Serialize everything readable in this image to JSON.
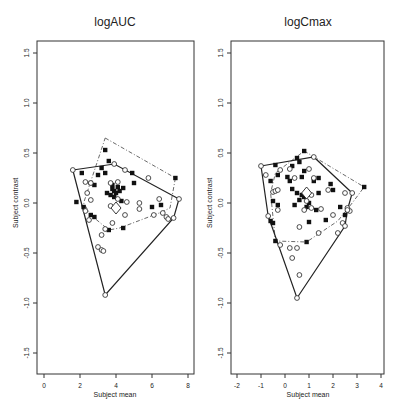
{
  "chart_data": [
    {
      "type": "scatter",
      "title": "logAUC",
      "xlabel": "Subject mean",
      "ylabel": "Subject contrast",
      "xlim": [
        -0.5,
        8.3
      ],
      "ylim": [
        -1.6,
        1.6
      ],
      "xticks": [
        0,
        2,
        4,
        6,
        8
      ],
      "yticks": [
        -1.5,
        -1.0,
        -0.5,
        0.0,
        0.5,
        1.0,
        1.5
      ],
      "grid": false,
      "legend": null,
      "hull_solid": [
        [
          1.6,
          0.33
        ],
        [
          3.9,
          0.39
        ],
        [
          7.5,
          0.04
        ],
        [
          7.2,
          -0.15
        ],
        [
          3.4,
          -0.92
        ],
        [
          1.6,
          0.33
        ]
      ],
      "hull_dashdot": [
        [
          3.4,
          0.65
        ],
        [
          7.3,
          0.25
        ],
        [
          7.0,
          -0.05
        ],
        [
          6.4,
          -0.1
        ],
        [
          4.2,
          -0.25
        ],
        [
          3.6,
          -0.27
        ],
        [
          2.6,
          -0.12
        ],
        [
          2.2,
          0.0
        ],
        [
          3.4,
          0.65
        ]
      ],
      "series": [
        {
          "name": "filled squares",
          "marker": "square-filled",
          "points": [
            [
              3.4,
              0.53
            ],
            [
              3.6,
              0.42
            ],
            [
              3.2,
              0.35
            ],
            [
              3.0,
              0.28
            ],
            [
              3.4,
              0.3
            ],
            [
              2.1,
              0.3
            ],
            [
              2.6,
              0.2
            ],
            [
              2.8,
              0.18
            ],
            [
              4.9,
              0.3
            ],
            [
              5.0,
              0.2
            ],
            [
              7.3,
              0.25
            ],
            [
              3.8,
              0.14
            ],
            [
              3.9,
              0.12
            ],
            [
              4.0,
              0.1
            ],
            [
              3.7,
              0.08
            ],
            [
              3.9,
              0.06
            ],
            [
              4.1,
              0.16
            ],
            [
              3.8,
              0.18
            ],
            [
              4.2,
              0.12
            ],
            [
              4.3,
              0.02
            ],
            [
              4.4,
              0.15
            ],
            [
              3.5,
              0.1
            ],
            [
              1.8,
              0.01
            ],
            [
              2.2,
              -0.04
            ],
            [
              2.6,
              -0.12
            ],
            [
              2.8,
              -0.14
            ],
            [
              6.0,
              -0.04
            ],
            [
              6.5,
              -0.02
            ],
            [
              3.6,
              -0.27
            ],
            [
              4.4,
              -0.25
            ]
          ]
        },
        {
          "name": "open circles",
          "marker": "circle-open",
          "points": [
            [
              1.6,
              0.33
            ],
            [
              3.9,
              0.39
            ],
            [
              4.5,
              0.33
            ],
            [
              5.8,
              0.25
            ],
            [
              2.3,
              0.21
            ],
            [
              2.6,
              0.2
            ],
            [
              3.7,
              0.2
            ],
            [
              4.1,
              0.21
            ],
            [
              2.4,
              0.1
            ],
            [
              2.6,
              0.03
            ],
            [
              4.1,
              0.04
            ],
            [
              4.6,
              0.01
            ],
            [
              5.3,
              0.0
            ],
            [
              5.3,
              -0.06
            ],
            [
              3.7,
              -0.03
            ],
            [
              2.3,
              -0.08
            ],
            [
              2.5,
              -0.17
            ],
            [
              4.5,
              -0.12
            ],
            [
              3.8,
              -0.2
            ],
            [
              3.4,
              -0.26
            ],
            [
              3.2,
              -0.32
            ],
            [
              3.0,
              -0.44
            ],
            [
              3.2,
              -0.47
            ],
            [
              3.3,
              -0.48
            ],
            [
              6.1,
              -0.12
            ],
            [
              6.6,
              -0.1
            ],
            [
              6.8,
              -0.14
            ],
            [
              6.9,
              -0.16
            ],
            [
              7.2,
              -0.15
            ],
            [
              7.5,
              0.04
            ],
            [
              6.4,
              0.04
            ],
            [
              3.4,
              -0.92
            ]
          ]
        },
        {
          "name": "center",
          "marker": "diamond-open",
          "points": [
            [
              4.0,
              -0.05
            ]
          ]
        }
      ]
    },
    {
      "type": "scatter",
      "title": "logCmax",
      "xlabel": "Subject mean",
      "ylabel": "Subject contrast",
      "xlim": [
        -2.3,
        4.3
      ],
      "ylim": [
        -1.6,
        1.6
      ],
      "xticks": [
        -2,
        -1,
        0,
        1,
        2,
        3,
        4
      ],
      "yticks": [
        -1.5,
        -1.0,
        -0.5,
        0.0,
        0.5,
        1.0,
        1.5
      ],
      "grid": false,
      "legend": null,
      "hull_solid": [
        [
          -1.0,
          0.37
        ],
        [
          1.2,
          0.46
        ],
        [
          2.8,
          0.1
        ],
        [
          2.6,
          -0.07
        ],
        [
          2.5,
          -0.23
        ],
        [
          0.5,
          -0.95
        ],
        [
          -0.7,
          -0.13
        ],
        [
          -1.0,
          0.37
        ]
      ],
      "hull_dashdot": [
        [
          0.8,
          0.52
        ],
        [
          3.3,
          0.16
        ],
        [
          2.8,
          0.0
        ],
        [
          2.2,
          -0.18
        ],
        [
          0.9,
          -0.39
        ],
        [
          -0.4,
          -0.38
        ],
        [
          -0.6,
          0.1
        ],
        [
          -0.4,
          0.3
        ],
        [
          0.8,
          0.52
        ]
      ],
      "series": [
        {
          "name": "filled squares",
          "marker": "square-filled",
          "points": [
            [
              0.8,
              0.52
            ],
            [
              0.5,
              0.45
            ],
            [
              0.6,
              0.41
            ],
            [
              -0.4,
              0.38
            ],
            [
              0.3,
              0.37
            ],
            [
              0.8,
              0.32
            ],
            [
              -0.3,
              0.28
            ],
            [
              0.1,
              0.26
            ],
            [
              0.7,
              0.26
            ],
            [
              1.4,
              0.25
            ],
            [
              -0.6,
              0.22
            ],
            [
              0.2,
              0.22
            ],
            [
              1.2,
              0.22
            ],
            [
              0.3,
              0.14
            ],
            [
              1.4,
              0.1
            ],
            [
              1.9,
              0.19
            ],
            [
              2.0,
              0.13
            ],
            [
              0.5,
              0.1
            ],
            [
              0.7,
              0.08
            ],
            [
              0.8,
              0.06
            ],
            [
              0.9,
              0.1
            ],
            [
              0.6,
              0.03
            ],
            [
              1.0,
              0.0
            ],
            [
              0.9,
              -0.04
            ],
            [
              1.3,
              -0.07
            ],
            [
              -0.5,
              0.02
            ],
            [
              -0.3,
              -0.02
            ],
            [
              0.4,
              -0.02
            ],
            [
              2.3,
              -0.04
            ],
            [
              2.6,
              -0.07
            ],
            [
              2.5,
              -0.12
            ],
            [
              -0.6,
              -0.18
            ],
            [
              -0.5,
              -0.2
            ],
            [
              1.0,
              -0.19
            ],
            [
              1.7,
              -0.17
            ],
            [
              -0.4,
              -0.38
            ],
            [
              0.9,
              -0.39
            ],
            [
              3.3,
              0.16
            ]
          ]
        },
        {
          "name": "open circles",
          "marker": "circle-open",
          "points": [
            [
              -1.0,
              0.37
            ],
            [
              1.2,
              0.46
            ],
            [
              -0.8,
              0.28
            ],
            [
              -0.2,
              0.33
            ],
            [
              0.2,
              0.34
            ],
            [
              1.0,
              0.34
            ],
            [
              0.4,
              0.25
            ],
            [
              1.2,
              0.25
            ],
            [
              -0.5,
              0.11
            ],
            [
              -0.4,
              0.12
            ],
            [
              -0.3,
              0.13
            ],
            [
              1.8,
              0.13
            ],
            [
              2.5,
              0.1
            ],
            [
              1.1,
              0.08
            ],
            [
              0.9,
              0.02
            ],
            [
              0.8,
              -0.07
            ],
            [
              1.1,
              -0.05
            ],
            [
              -0.3,
              -0.07
            ],
            [
              1.5,
              -0.06
            ],
            [
              2.0,
              -0.12
            ],
            [
              2.6,
              -0.05
            ],
            [
              2.7,
              -0.08
            ],
            [
              2.4,
              -0.2
            ],
            [
              2.2,
              -0.3
            ],
            [
              0.6,
              -0.24
            ],
            [
              1.4,
              -0.3
            ],
            [
              -0.2,
              -0.42
            ],
            [
              0.2,
              -0.45
            ],
            [
              0.5,
              -0.45
            ],
            [
              0.3,
              -0.55
            ],
            [
              0.6,
              -0.72
            ],
            [
              2.8,
              0.1
            ],
            [
              2.6,
              -0.07
            ],
            [
              2.5,
              -0.23
            ],
            [
              -0.7,
              -0.13
            ],
            [
              0.5,
              -0.95
            ]
          ]
        },
        {
          "name": "center",
          "marker": "diamond-open",
          "points": [
            [
              0.9,
              0.1
            ]
          ]
        }
      ]
    }
  ],
  "panels": [
    {
      "title": "logAUC",
      "xlabel": "Subject mean",
      "ylabel": "Subject contrast",
      "xtick_labels": [
        "0",
        "2",
        "4",
        "6",
        "8"
      ],
      "ytick_labels": [
        "1.5",
        "1.0",
        "0.5",
        "0.0",
        "-0.5",
        "-1.0",
        "-1.5"
      ]
    },
    {
      "title": "logCmax",
      "xlabel": "Subject mean",
      "ylabel": "Subject contrast",
      "xtick_labels": [
        "-2",
        "-1",
        "0",
        "1",
        "2",
        "3",
        "4"
      ],
      "ytick_labels": [
        "1.5",
        "1.0",
        "0.5",
        "0.0",
        "-0.5",
        "-1.0",
        "-1.5"
      ]
    }
  ]
}
